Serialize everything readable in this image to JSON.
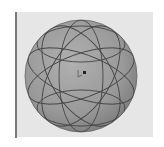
{
  "viewport": {
    "background": "#e6e6e6",
    "object": "sphere",
    "sphere": {
      "center": [
        81,
        76
      ],
      "radius": 56,
      "fill": "#9c9c9c",
      "edge": "#555555"
    },
    "grid_lines": "great-circles",
    "cursor": "pointer-in-center"
  },
  "colors": {
    "page_background": "#ffffff",
    "rule": "#7a7a7a",
    "line": "#4a4a4a"
  }
}
